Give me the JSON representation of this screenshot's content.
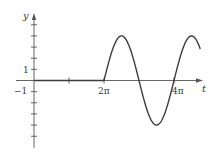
{
  "chart_data": {
    "type": "line",
    "title": "",
    "xlabel": "t",
    "ylabel": "y",
    "x_tick_labels": [
      "2π",
      "4π"
    ],
    "y_tick_labels": [
      "1",
      "−1"
    ],
    "x_ticks": [
      "π",
      "2π",
      "4π"
    ],
    "y_ticks": [
      -5,
      -4,
      -3,
      -2,
      -1,
      1,
      2,
      3,
      4,
      5
    ],
    "ylim": [
      -5.5,
      5.8
    ],
    "xlim": [
      0,
      4.8
    ],
    "x_unit": "π",
    "grid": false,
    "legend": null,
    "series": [
      {
        "name": "y(t)",
        "description": "y = 0 for 0 ≤ t < 2π; y = 4 sin(t) for t ≥ 2π",
        "piecewise": [
          {
            "t_range_pi": [
              0,
              2
            ],
            "expr": "0"
          },
          {
            "t_range_pi": [
              2,
              4.75
            ],
            "expr": "4 sin(t)"
          }
        ],
        "key_points": [
          {
            "t": "0",
            "y": 0
          },
          {
            "t": "2π",
            "y": 0
          },
          {
            "t": "2.5π",
            "y": 4
          },
          {
            "t": "3π",
            "y": 0
          },
          {
            "t": "3.5π",
            "y": -4
          },
          {
            "t": "4π",
            "y": 0
          },
          {
            "t": "4.5π",
            "y": 4
          }
        ]
      }
    ]
  },
  "labels": {
    "y_axis": "y",
    "t_axis": "t",
    "tick_1": "1",
    "tick_neg1": "−1",
    "tick_2pi": "2π",
    "tick_4pi": "4π"
  },
  "colors": {
    "axis": "#555555",
    "curve": "#3c3c3c"
  }
}
